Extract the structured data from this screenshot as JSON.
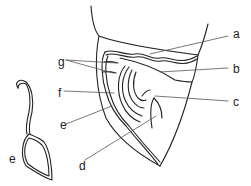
{
  "diagram": {
    "colors": {
      "stroke": "#222222",
      "leader": "#555555",
      "background": "#ffffff"
    },
    "labels": [
      {
        "id": "a",
        "text": "a",
        "x": 233,
        "y": 28
      },
      {
        "id": "b",
        "text": "b",
        "x": 233,
        "y": 63
      },
      {
        "id": "c",
        "text": "c",
        "x": 233,
        "y": 96
      },
      {
        "id": "d",
        "text": "d",
        "x": 79,
        "y": 160
      },
      {
        "id": "e",
        "text": "e",
        "x": 60,
        "y": 119
      },
      {
        "id": "f",
        "text": "f",
        "x": 58,
        "y": 87
      },
      {
        "id": "g",
        "text": "g",
        "x": 58,
        "y": 56
      },
      {
        "id": "e2",
        "text": "e",
        "x": 9,
        "y": 153
      }
    ]
  }
}
